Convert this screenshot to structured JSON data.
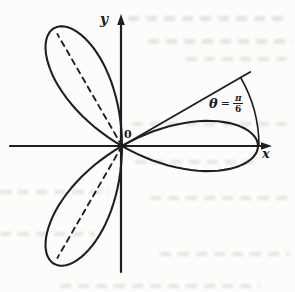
{
  "figure": {
    "background_color": "#fcfcfa",
    "ink_color": "#1f1f1f",
    "labels": {
      "y_axis": "y",
      "x_axis": "x",
      "origin": "0",
      "angle_theta": "θ",
      "angle_equals": "=",
      "angle_numerator": "π",
      "angle_denominator": "6"
    }
  },
  "chart_data": {
    "type": "polar-rose",
    "equation": "r = a·cos(3θ)",
    "num_petals": 3,
    "petal_axis_angles_deg": [
      0,
      120,
      240
    ],
    "dashed_petal_axes_deg": [
      120,
      240
    ],
    "petal_length_px": 136,
    "marked_angle": {
      "text": "θ = π/6",
      "degrees": 30,
      "ray_length_px": 148,
      "arc_radius_px": 137
    },
    "axes": {
      "x_label": "x",
      "y_label": "y",
      "origin_label": "0",
      "arrows": [
        "x-right",
        "y-up"
      ],
      "grid": false
    }
  }
}
